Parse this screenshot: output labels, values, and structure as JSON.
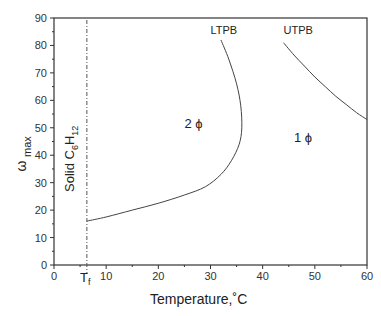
{
  "chart_data": {
    "type": "line",
    "title": "",
    "xlabel": "Temperature,˚C",
    "ylabel_main": "ω",
    "ylabel_sub": "max",
    "xlim": [
      0,
      60
    ],
    "ylim": [
      0,
      90
    ],
    "xticks": [
      0,
      10,
      20,
      30,
      40,
      50,
      60
    ],
    "yticks": [
      0,
      10,
      20,
      30,
      40,
      50,
      60,
      70,
      80,
      90
    ],
    "grid": false,
    "series": [
      {
        "name": "LTPB",
        "x": [
          6.3,
          10,
          15,
          20,
          25,
          29,
          32,
          34,
          35.5,
          36,
          35.8,
          35,
          33.5,
          32
        ],
        "y": [
          16,
          17.5,
          20,
          22.5,
          25.5,
          28.5,
          33,
          38,
          44,
          50,
          58,
          66,
          75,
          82
        ]
      },
      {
        "name": "UTPB",
        "x": [
          44,
          46,
          48,
          50,
          52,
          54,
          56,
          58,
          60
        ],
        "y": [
          81,
          76.5,
          72.5,
          68.5,
          65,
          61.5,
          58.5,
          55.5,
          53
        ]
      }
    ],
    "vertical_line": {
      "name": "T_f",
      "x": 6.3,
      "label_main": "T",
      "label_sub": "f",
      "style": "dash-dot"
    },
    "annotations": [
      {
        "text": "LTPB",
        "x": 30,
        "y": 84
      },
      {
        "text": "UTPB",
        "x": 44,
        "y": 84
      },
      {
        "text": "2 ϕ",
        "x": 25,
        "y": 50
      },
      {
        "text": "1 ϕ",
        "x": 46,
        "y": 45
      }
    ],
    "region_label": {
      "main": "Solid C",
      "sub1": "6",
      "mid": "H",
      "sub2": "12"
    }
  }
}
